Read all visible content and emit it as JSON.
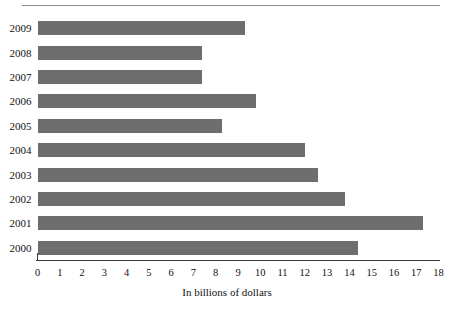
{
  "chart_data": {
    "type": "bar",
    "orientation": "horizontal",
    "title": "",
    "subtitle": "",
    "xlabel": "In billions of dollars",
    "ylabel": "",
    "categories": [
      "2009",
      "2008",
      "2007",
      "2006",
      "2005",
      "2004",
      "2003",
      "2002",
      "2001",
      "2000"
    ],
    "values": [
      9.3,
      7.4,
      7.4,
      9.8,
      8.3,
      12.0,
      12.6,
      13.8,
      17.3,
      14.4
    ],
    "xlim": [
      0,
      18
    ],
    "xticks": [
      0,
      1,
      2,
      3,
      4,
      5,
      6,
      7,
      8,
      9,
      10,
      11,
      12,
      13,
      14,
      15,
      16,
      17,
      18
    ],
    "xticklabels": [
      "0",
      "1",
      "2",
      "3",
      "4",
      "5",
      "6",
      "7",
      "8",
      "9",
      "10",
      "11",
      "12",
      "13",
      "14",
      "15",
      "16",
      "17",
      "18"
    ],
    "grid": false,
    "legend": null,
    "legend_position": "none",
    "bar_color": "#6e6e6e",
    "axis_color": "#3a3a3a",
    "rule_color": "#8d8d8d",
    "text_color": "#111111"
  }
}
